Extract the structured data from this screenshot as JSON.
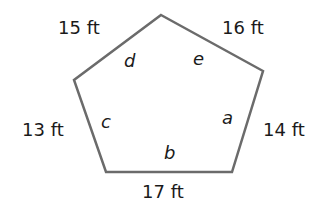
{
  "figure": {
    "shape": "pentagon",
    "stroke_color": "#6b6b6b",
    "side_labels": {
      "top_left": "15 ft",
      "top_right": "16 ft",
      "left": "13 ft",
      "right": "14 ft",
      "bottom": "17 ft"
    },
    "angle_labels": {
      "top_left": "d",
      "top_right": "e",
      "left": "c",
      "right": "a",
      "bottom": "b"
    }
  }
}
